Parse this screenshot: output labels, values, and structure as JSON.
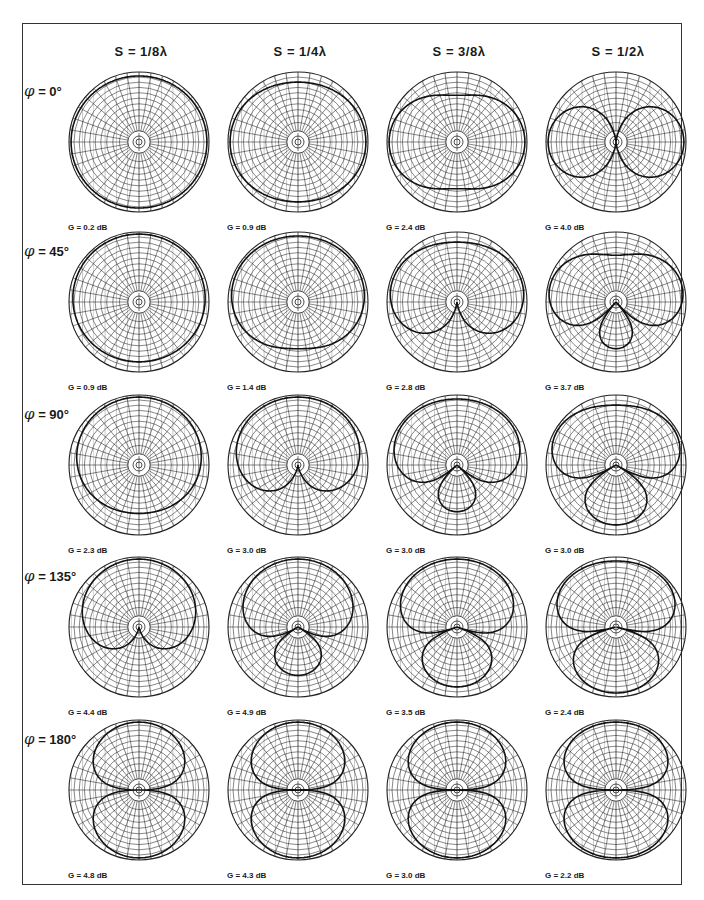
{
  "figure": {
    "columns": [
      {
        "label": "S = 1/8λ",
        "spacing_wavelengths": 0.125
      },
      {
        "label": "S = 1/4λ",
        "spacing_wavelengths": 0.25
      },
      {
        "label": "S = 3/8λ",
        "spacing_wavelengths": 0.375
      },
      {
        "label": "S = 1/2λ",
        "spacing_wavelengths": 0.5
      }
    ],
    "rows": [
      {
        "symbol": "φ",
        "label": "= 0°",
        "phase_deg": 0
      },
      {
        "symbol": "φ",
        "label": "= 45°",
        "phase_deg": 45
      },
      {
        "symbol": "φ",
        "label": "= 90°",
        "phase_deg": 90
      },
      {
        "symbol": "φ",
        "label": "= 135°",
        "phase_deg": 135
      },
      {
        "symbol": "φ",
        "label": "= 180°",
        "phase_deg": 180
      }
    ],
    "gains": [
      [
        "G = 0.2 dB",
        "G = 0.9 dB",
        "G = 2.4 dB",
        "G = 4.0 dB"
      ],
      [
        "G = 0.9 dB",
        "G = 1.4 dB",
        "G = 2.8 dB",
        "G = 3.7 dB"
      ],
      [
        "G = 2.3 dB",
        "G = 3.0 dB",
        "G = 3.0 dB",
        "G = 3.0 dB"
      ],
      [
        "G = 4.4 dB",
        "G = 4.9 dB",
        "G = 3.5 dB",
        "G = 2.4 dB"
      ],
      [
        "G = 4.8 dB",
        "G = 4.3 dB",
        "G = 3.0 dB",
        "G = 2.2 dB"
      ]
    ],
    "grid": {
      "spokes": 36,
      "rings": 10,
      "color": "#222222",
      "pattern_color": "#111111"
    }
  },
  "chart_data": {
    "type": "polar",
    "categories_columns": [
      "S = 1/8λ",
      "S = 1/4λ",
      "S = 3/8λ",
      "S = 1/2λ"
    ],
    "categories_rows": [
      "φ = 0°",
      "φ = 45°",
      "φ = 90°",
      "φ = 135°",
      "φ = 180°"
    ],
    "gain_dB": [
      [
        0.2,
        0.9,
        2.4,
        4.0
      ],
      [
        0.9,
        1.4,
        2.8,
        3.7
      ],
      [
        2.3,
        3.0,
        3.0,
        3.0
      ],
      [
        4.4,
        4.9,
        3.5,
        2.4
      ],
      [
        4.8,
        4.3,
        3.0,
        2.2
      ]
    ]
  }
}
